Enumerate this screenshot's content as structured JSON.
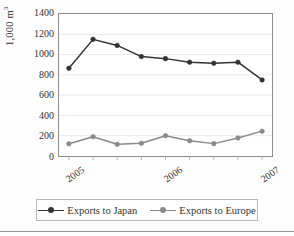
{
  "chart_data": {
    "type": "line",
    "title": "",
    "subtitle": "",
    "xlabel": "",
    "ylabel": "1,000 m",
    "ylabel_superscript": "3",
    "ylim": [
      0,
      1400
    ],
    "yticks": [
      1400,
      1200,
      1000,
      800,
      600,
      400,
      200,
      0
    ],
    "ytick_labels": [
      "1400",
      "1200",
      "1000",
      "800",
      "600",
      "400",
      "200",
      "0"
    ],
    "grid": "horizontal",
    "legend_position": "bottom",
    "x": [
      1,
      2,
      3,
      4,
      5,
      6,
      7,
      8,
      9
    ],
    "xtick_positions": [
      1,
      5,
      9
    ],
    "xtick_labels": [
      "2005",
      "2006",
      "2007"
    ],
    "series": [
      {
        "name": "Exports to Japan",
        "color": "#333333",
        "marker": "circle",
        "values": [
          865,
          1150,
          1090,
          980,
          960,
          925,
          915,
          925,
          750
        ]
      },
      {
        "name": "Exports to Europe",
        "color": "#8a8a8a",
        "marker": "circle",
        "values": [
          120,
          190,
          115,
          125,
          200,
          150,
          122,
          178,
          245
        ]
      }
    ]
  },
  "legend": {
    "items": [
      {
        "label": "Exports to Japan",
        "color": "#333333"
      },
      {
        "label": "Exports to Europe",
        "color": "#8a8a8a"
      }
    ]
  },
  "axis": {
    "y_label_text": "1,000 m",
    "y_label_sup": "3"
  }
}
